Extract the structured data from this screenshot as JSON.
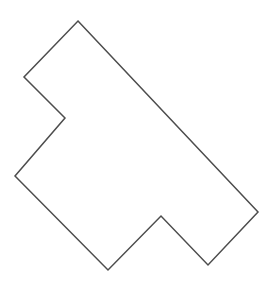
{
  "figure": {
    "type": "line-drawing",
    "canvas": {
      "width": 276,
      "height": 297,
      "background_color": "#ffffff"
    },
    "shape": {
      "name": "rotated-t-shaped-polygon",
      "vertex_count": 8,
      "closed": true,
      "fill_color": "#ffffff",
      "stroke_color": "#4d4d4d",
      "stroke_width": 1.5,
      "vertices": [
        {
          "label": "top-apex",
          "x": 78,
          "y": 21,
          "kind": "convex"
        },
        {
          "label": "right-far",
          "x": 258,
          "y": 212,
          "kind": "convex"
        },
        {
          "label": "bottom-right",
          "x": 208,
          "y": 265,
          "kind": "convex"
        },
        {
          "label": "bottom-notch",
          "x": 161,
          "y": 216,
          "kind": "reflex"
        },
        {
          "label": "bottom-left",
          "x": 108,
          "y": 270,
          "kind": "convex"
        },
        {
          "label": "left-lower",
          "x": 15,
          "y": 176,
          "kind": "convex"
        },
        {
          "label": "left-notch",
          "x": 65,
          "y": 118,
          "kind": "reflex"
        },
        {
          "label": "left-upper",
          "x": 24,
          "y": 77,
          "kind": "convex"
        }
      ],
      "path_d": "M 78 21 L 258 212 L 208 265 L 161 216 L 108 270 L 15 176 L 65 118 L 24 77 Z"
    }
  }
}
